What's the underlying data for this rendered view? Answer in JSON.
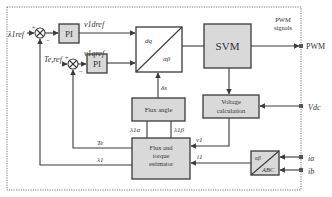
{
  "diagram": {
    "inputs": {
      "flux_ref": "λ1ref",
      "torque_ref": "Te,ref",
      "dc_voltage": "Vdc",
      "current_a": "ia",
      "current_b": "ib"
    },
    "outputs": {
      "pwm": "PWM",
      "pwm_note_line1": "PWM",
      "pwm_note_line2": "signals"
    },
    "blocks": {
      "pi1": "PI",
      "pi2": "PI",
      "dq_ab_top": "dq",
      "dq_ab_bottom": "αβ",
      "svm": "SVM",
      "flux_angle": "Flux angle",
      "voltage_calc_line1": "Voltage",
      "voltage_calc_line2": "calculation",
      "estimator_line1": "Flux and",
      "estimator_line2": "torque",
      "estimator_line3": "estimator",
      "ab_abc_top": "αβ",
      "ab_abc_bottom": "ABC"
    },
    "signals": {
      "v1d_ref": "v1dref",
      "v1q_ref": "v1qref",
      "delta_s": "δs",
      "lambda_1alpha": "λ1α",
      "lambda_1beta": "λ1β",
      "v1_vec": "v1",
      "i1_vec": "i1",
      "te_fb": "Te",
      "lambda1_fb": "λ1"
    },
    "sum_signs": {
      "plus": "+",
      "minus": "−"
    }
  }
}
